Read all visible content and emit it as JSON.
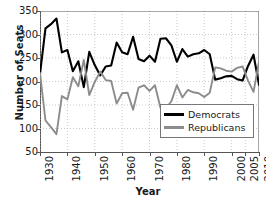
{
  "chart_data": {
    "type": "line",
    "title": "",
    "xlabel": "Year",
    "ylabel": "Number of Seats",
    "ylim": [
      50,
      350
    ],
    "ytick_values": [
      350,
      300,
      250,
      200,
      150,
      100,
      50
    ],
    "ytick_labels": [
      "350",
      "300",
      "250",
      "200",
      "150",
      "100",
      "50"
    ],
    "xlim": [
      1930,
      2010
    ],
    "xtick_values": [
      1930,
      1940,
      1950,
      1960,
      1970,
      1980,
      1990,
      2000,
      2005,
      2010
    ],
    "xtick_labels": [
      "1930",
      "1940",
      "1950",
      "1960",
      "1970",
      "1980",
      "1990",
      "2000",
      "2005",
      "2010"
    ],
    "grid": true,
    "legend_position": "lower-right",
    "x": [
      1930,
      1932,
      1934,
      1936,
      1938,
      1940,
      1942,
      1944,
      1946,
      1948,
      1950,
      1952,
      1954,
      1956,
      1958,
      1960,
      1962,
      1964,
      1966,
      1968,
      1970,
      1972,
      1974,
      1976,
      1978,
      1980,
      1982,
      1984,
      1986,
      1988,
      1990,
      1992,
      1994,
      1996,
      1998,
      2000,
      2002,
      2004,
      2006,
      2008,
      2010
    ],
    "series": [
      {
        "name": "Democrats",
        "color": "#000000",
        "values": [
          216,
          313,
          322,
          334,
          262,
          267,
          222,
          243,
          188,
          263,
          235,
          213,
          232,
          234,
          283,
          262,
          258,
          295,
          248,
          243,
          255,
          242,
          291,
          292,
          277,
          242,
          269,
          253,
          258,
          260,
          267,
          258,
          204,
          207,
          211,
          212,
          205,
          202,
          233,
          257,
          193
        ]
      },
      {
        "name": "Republicans",
        "color": "#8c8c8c",
        "values": [
          218,
          117,
          103,
          88,
          169,
          162,
          209,
          190,
          246,
          171,
          199,
          221,
          203,
          201,
          153,
          175,
          176,
          140,
          187,
          192,
          180,
          192,
          144,
          143,
          158,
          192,
          166,
          182,
          177,
          175,
          167,
          176,
          230,
          228,
          223,
          221,
          229,
          232,
          202,
          178,
          242
        ]
      }
    ]
  }
}
